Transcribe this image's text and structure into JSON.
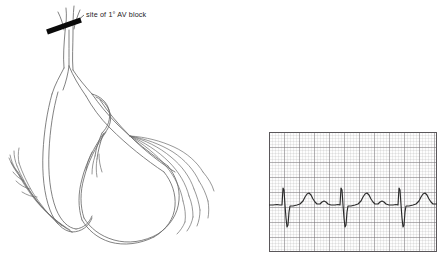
{
  "figure": {
    "background_color": "#ffffff",
    "width": 447,
    "height": 262
  },
  "annotation": {
    "label_prefix": "site of",
    "label_degree": "1°",
    "label_suffix": "AV block",
    "full_text": "site of 1° AV block",
    "marker_color": "#0a0a0a",
    "leader_color": "#3a3a3a"
  },
  "anatomy": {
    "name": "cardiac-conduction-system",
    "line_color": "#6b6b6b",
    "dark_line_color": "#3c3c3c",
    "parts": [
      {
        "name": "av-node-his-bundle",
        "label": "AV node / bundle of His"
      },
      {
        "name": "left-bundle-branch",
        "label": "Left bundle branch"
      },
      {
        "name": "right-bundle-branch",
        "label": "Right bundle branch"
      },
      {
        "name": "left-purkinje-fibers",
        "label": "Left Purkinje fibers"
      },
      {
        "name": "right-purkinje-fibers",
        "label": "Right Purkinje fibers"
      }
    ]
  },
  "ecg": {
    "name": "ecg-rhythm-strip",
    "paper_color": "#fdfdfd",
    "fine_grid_color": "#b9b6b8",
    "bold_grid_color": "#6e6b6e",
    "trace_color": "#2b2b2b",
    "border_color": "#5a575a",
    "fine_grid_px": 3,
    "bold_grid_px": 15,
    "baseline_y": 73,
    "beats": 3,
    "beat_spacing_px": 58,
    "first_beat_x": 14,
    "rhythm": "sinus rhythm with prolonged PR interval",
    "chart_data": {
      "type": "line",
      "title": "ECG rhythm strip",
      "xlabel": "",
      "ylabel": "",
      "grid": true,
      "legend": "none",
      "xlim": [
        0,
        168
      ],
      "ylim": [
        0,
        120
      ],
      "series": [
        {
          "name": "ecg-trace",
          "points": [
            [
              0,
              73
            ],
            [
              4,
              73
            ],
            [
              8,
              72.5
            ],
            [
              11,
              73
            ],
            [
              13,
              73
            ],
            [
              14,
              56
            ],
            [
              15,
              58
            ],
            [
              16,
              73
            ],
            [
              17,
              86
            ],
            [
              18,
              95
            ],
            [
              19,
              93
            ],
            [
              20,
              80
            ],
            [
              21,
              74
            ],
            [
              24,
              74
            ],
            [
              28,
              73
            ],
            [
              31,
              72
            ],
            [
              34,
              69
            ],
            [
              36,
              65
            ],
            [
              38,
              62
            ],
            [
              40,
              61
            ],
            [
              42,
              63
            ],
            [
              44,
              67
            ],
            [
              46,
              70
            ],
            [
              48,
              72
            ],
            [
              51,
              72
            ],
            [
              53,
              70
            ],
            [
              55,
              69
            ],
            [
              57,
              70
            ],
            [
              59,
              72
            ],
            [
              62,
              73
            ],
            [
              66,
              73
            ],
            [
              69,
              72.5
            ],
            [
              71,
              73
            ],
            [
              72,
              56
            ],
            [
              73,
              58
            ],
            [
              74,
              73
            ],
            [
              75,
              86
            ],
            [
              76,
              95
            ],
            [
              77,
              93
            ],
            [
              78,
              80
            ],
            [
              79,
              74
            ],
            [
              82,
              74
            ],
            [
              86,
              73
            ],
            [
              89,
              72
            ],
            [
              92,
              69
            ],
            [
              94,
              65
            ],
            [
              96,
              62
            ],
            [
              98,
              61
            ],
            [
              100,
              63
            ],
            [
              102,
              67
            ],
            [
              104,
              70
            ],
            [
              106,
              72
            ],
            [
              109,
              72
            ],
            [
              111,
              70
            ],
            [
              113,
              69
            ],
            [
              115,
              70
            ],
            [
              117,
              72
            ],
            [
              120,
              73
            ],
            [
              124,
              73
            ],
            [
              127,
              72.5
            ],
            [
              129,
              73
            ],
            [
              130,
              56
            ],
            [
              131,
              58
            ],
            [
              132,
              73
            ],
            [
              133,
              86
            ],
            [
              134,
              95
            ],
            [
              135,
              93
            ],
            [
              136,
              80
            ],
            [
              137,
              74
            ],
            [
              140,
              74
            ],
            [
              144,
              73
            ],
            [
              147,
              72
            ],
            [
              150,
              69
            ],
            [
              152,
              65
            ],
            [
              154,
              62
            ],
            [
              156,
              61
            ],
            [
              158,
              63
            ],
            [
              160,
              67
            ],
            [
              162,
              70
            ],
            [
              164,
              72
            ],
            [
              168,
              72
            ]
          ]
        }
      ]
    }
  }
}
